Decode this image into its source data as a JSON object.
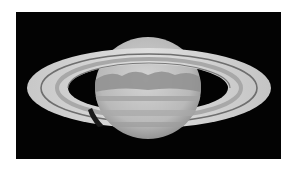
{
  "image": {
    "subject": "Saturn",
    "description": "Grayscale telescope image of Saturn with its rings on a black background",
    "colors": {
      "background": "#ffffff",
      "sky": "#030303",
      "ring_light": "#d8d8d8",
      "ring_mid": "#b8b8b8",
      "globe_light": "#cfcfcf",
      "globe_band": "#8e8e8e"
    }
  }
}
